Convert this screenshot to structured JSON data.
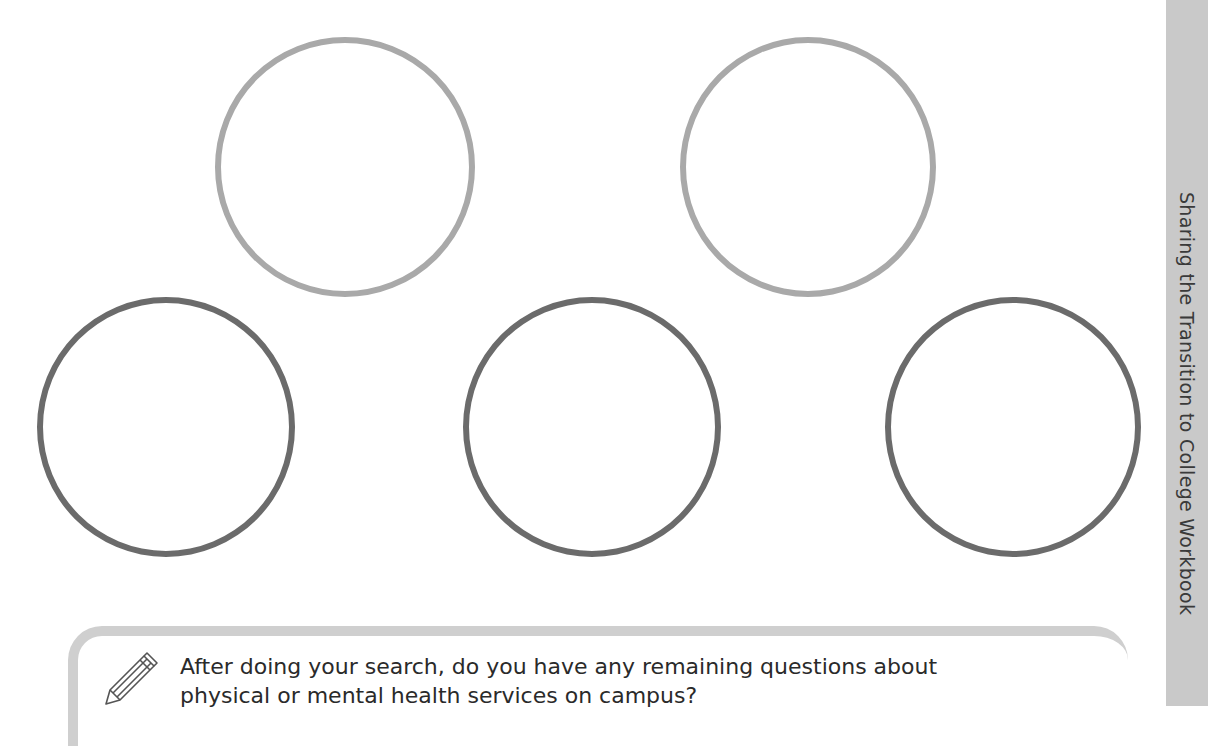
{
  "side_tab": {
    "label": "Sharing the Transition to College Workbook"
  },
  "circles": [
    {
      "name": "circle-top-left",
      "tone": "light"
    },
    {
      "name": "circle-top-right",
      "tone": "light"
    },
    {
      "name": "circle-bottom-left",
      "tone": "dark"
    },
    {
      "name": "circle-bottom-middle",
      "tone": "dark"
    },
    {
      "name": "circle-bottom-right",
      "tone": "dark"
    }
  ],
  "note": {
    "icon": "pencil-icon",
    "line1": "After doing your search, do you have any remaining questions about",
    "line2": "physical or mental health services on campus?"
  },
  "colors": {
    "light_circle": "#a9a9a9",
    "dark_circle": "#6b6b6b",
    "side_tab": "#c9c9c9",
    "note_border": "#cfcfcf"
  }
}
